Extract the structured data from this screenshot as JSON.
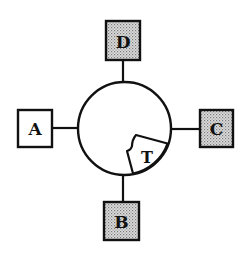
{
  "diagram": {
    "center_label": "",
    "hub": {
      "shape": "circle",
      "wedge_label": "T"
    },
    "nodes": [
      {
        "id": "top",
        "label": "D",
        "fill": "shaded"
      },
      {
        "id": "left",
        "label": "A",
        "fill": "white"
      },
      {
        "id": "right",
        "label": "C",
        "fill": "shaded"
      },
      {
        "id": "bottom",
        "label": "B",
        "fill": "shaded"
      }
    ],
    "connections": [
      {
        "from": "hub",
        "to": "D"
      },
      {
        "from": "hub",
        "to": "A"
      },
      {
        "from": "hub",
        "to": "C"
      },
      {
        "from": "hub",
        "to": "B"
      }
    ]
  },
  "colors": {
    "stroke": "#111111",
    "shade_dot": "#8a8a8a",
    "shade_bg": "#d8d8d8",
    "background": "#ffffff"
  }
}
